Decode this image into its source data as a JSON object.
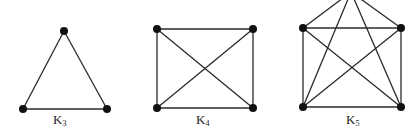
{
  "graphs": [
    {
      "name": "K",
      "subscript": "3",
      "vertices": [
        [
          64,
          31
        ],
        [
          23,
          109
        ],
        [
          107,
          109
        ]
      ],
      "label_pos": [
        58,
        124
      ]
    },
    {
      "name": "K",
      "subscript": "4",
      "vertices": [
        [
          157,
          29
        ],
        [
          253,
          29
        ],
        [
          253,
          108
        ],
        [
          157,
          108
        ]
      ],
      "label_pos": [
        201,
        124
      ]
    },
    {
      "name": "K",
      "subscript": "5",
      "vertices": [
        [
          351,
          -8
        ],
        [
          303,
          28
        ],
        [
          401,
          28
        ],
        [
          401,
          107
        ],
        [
          303,
          107
        ]
      ],
      "label_pos": [
        351,
        124
      ]
    }
  ],
  "colors": {
    "edge": "#2a2a2a",
    "vertex": "#111111"
  }
}
